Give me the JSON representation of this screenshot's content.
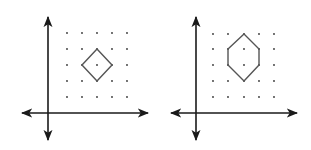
{
  "figure": {
    "background": "#ffffff",
    "axis_color": "#1a1a1a",
    "shape_color": "#555555",
    "dot_color": "#333333",
    "panels": [
      {
        "name": "left-grid",
        "axes": {
          "origin": [
            48,
            113
          ],
          "x_range": [
            22,
            148
          ],
          "y_range": [
            17,
            140
          ]
        },
        "grid": {
          "x": [
            67,
            82,
            97,
            112,
            127
          ],
          "y": [
            33,
            49,
            65,
            81,
            97
          ]
        },
        "shape": {
          "type": "square-rotated",
          "label": "rhombus",
          "vertices": [
            [
              97,
              49
            ],
            [
              112,
              65
            ],
            [
              97,
              81
            ],
            [
              82,
              65
            ]
          ]
        }
      },
      {
        "name": "right-grid",
        "axes": {
          "origin": [
            196,
            113
          ],
          "x_range": [
            171,
            297
          ],
          "y_range": [
            17,
            140
          ]
        },
        "grid": {
          "x": [
            213,
            228,
            244,
            259,
            274
          ],
          "y": [
            34,
            49,
            65,
            81,
            97
          ]
        },
        "shape": {
          "type": "hexagon",
          "label": "hexagon",
          "vertices": [
            [
              244,
              34
            ],
            [
              259,
              49
            ],
            [
              259,
              65
            ],
            [
              244,
              81
            ],
            [
              228,
              65
            ],
            [
              228,
              49
            ]
          ]
        }
      }
    ]
  }
}
